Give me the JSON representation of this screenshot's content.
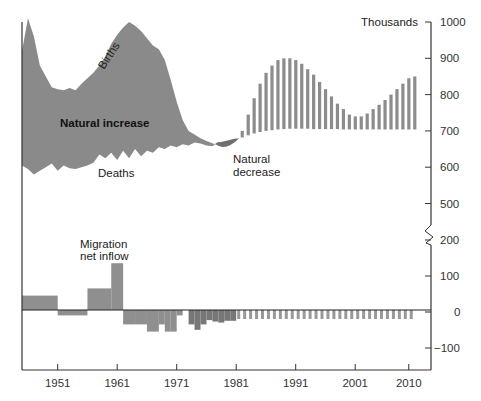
{
  "chart_data": {
    "type": "area",
    "title": "",
    "units_label": "Thousands",
    "xlabel": "",
    "ylabel": "Thousands",
    "x_ticks": [
      "1951",
      "1961",
      "1971",
      "1981",
      "1991",
      "2001",
      "2010"
    ],
    "y_ticks_upper": [
      "1000",
      "900",
      "800",
      "700",
      "600",
      "500"
    ],
    "y_ticks_lower": [
      "200",
      "100",
      "0",
      "−100"
    ],
    "axis_break": "between 500 and 200",
    "ylim_upper": [
      500,
      1000
    ],
    "ylim_lower": [
      -150,
      200
    ],
    "xlim": [
      1945,
      2012
    ],
    "grid": false,
    "annotations": {
      "births": "Births",
      "natural_increase": "Natural increase",
      "deaths": "Deaths",
      "natural_decrease": "Natural decrease",
      "natural_decrease_line1": "Natural",
      "natural_decrease_line2": "decrease",
      "migration_line1": "Migration",
      "migration_line2": "net inflow"
    },
    "series": [
      {
        "name": "Births (historical)",
        "x": [
          1945,
          1946,
          1947,
          1948,
          1949,
          1950,
          1951,
          1952,
          1953,
          1954,
          1955,
          1956,
          1957,
          1958,
          1959,
          1960,
          1961,
          1962,
          1963,
          1964,
          1965,
          1966,
          1967,
          1968,
          1969,
          1970,
          1971,
          1972,
          1973,
          1974,
          1975,
          1976,
          1977,
          1978,
          1979,
          1980,
          1981
        ],
        "values": [
          920,
          1010,
          960,
          880,
          850,
          820,
          815,
          812,
          818,
          812,
          830,
          845,
          860,
          880,
          905,
          940,
          965,
          985,
          1000,
          990,
          975,
          955,
          935,
          925,
          895,
          840,
          780,
          730,
          700,
          690,
          680,
          672,
          666,
          660,
          665,
          668,
          672
        ]
      },
      {
        "name": "Deaths (historical)",
        "x": [
          1945,
          1946,
          1947,
          1948,
          1949,
          1950,
          1951,
          1952,
          1953,
          1954,
          1955,
          1956,
          1957,
          1958,
          1959,
          1960,
          1961,
          1962,
          1963,
          1964,
          1965,
          1966,
          1967,
          1968,
          1969,
          1970,
          1971,
          1972,
          1973,
          1974,
          1975,
          1976,
          1977,
          1978,
          1979,
          1980,
          1981
        ],
        "values": [
          605,
          595,
          580,
          590,
          600,
          610,
          590,
          605,
          597,
          595,
          600,
          605,
          612,
          635,
          625,
          640,
          620,
          645,
          625,
          650,
          630,
          645,
          640,
          655,
          650,
          660,
          655,
          663,
          660,
          668,
          665,
          660,
          658,
          670,
          665,
          675,
          680
        ]
      },
      {
        "name": "Births (projected)",
        "x": [
          1982,
          1983,
          1984,
          1985,
          1986,
          1987,
          1988,
          1989,
          1990,
          1991,
          1992,
          1993,
          1994,
          1995,
          1996,
          1997,
          1998,
          1999,
          2000,
          2001,
          2002,
          2003,
          2004,
          2005,
          2006,
          2007,
          2008,
          2009,
          2010,
          2011
        ],
        "values": [
          700,
          745,
          790,
          830,
          860,
          880,
          895,
          900,
          900,
          895,
          885,
          870,
          855,
          835,
          815,
          795,
          775,
          760,
          745,
          740,
          740,
          748,
          760,
          772,
          785,
          800,
          815,
          830,
          845,
          850
        ]
      },
      {
        "name": "Deaths (projected)",
        "x": [
          1982,
          1983,
          1984,
          1985,
          1986,
          1987,
          1988,
          1989,
          1990,
          1991,
          1992,
          1993,
          1994,
          1995,
          1996,
          1997,
          1998,
          1999,
          2000,
          2001,
          2002,
          2003,
          2004,
          2005,
          2006,
          2007,
          2008,
          2009,
          2010,
          2011
        ],
        "values": [
          682,
          688,
          693,
          697,
          700,
          702,
          704,
          705,
          706,
          706,
          706,
          706,
          705,
          705,
          705,
          705,
          705,
          704,
          704,
          704,
          704,
          704,
          704,
          704,
          704,
          704,
          704,
          704,
          704,
          704
        ]
      },
      {
        "name": "Migration net inflow",
        "type": "bar",
        "bars": [
          {
            "from": 1945,
            "to": 1951,
            "value": 40
          },
          {
            "from": 1951,
            "to": 1956,
            "value": -15
          },
          {
            "from": 1956,
            "to": 1960,
            "value": 60
          },
          {
            "from": 1960,
            "to": 1962,
            "value": 130
          },
          {
            "from": 1962,
            "to": 1964,
            "value": -40
          },
          {
            "from": 1964,
            "to": 1966,
            "value": -40
          },
          {
            "from": 1966,
            "to": 1968,
            "value": -60
          },
          {
            "from": 1968,
            "to": 1969,
            "value": -40
          },
          {
            "from": 1969,
            "to": 1970,
            "value": -60
          },
          {
            "from": 1970,
            "to": 1971,
            "value": -60
          },
          {
            "from": 1971,
            "to": 1972,
            "value": -15
          },
          {
            "from": 1973,
            "to": 1974,
            "value": -40
          },
          {
            "from": 1974,
            "to": 1975,
            "value": -55
          },
          {
            "from": 1975,
            "to": 1976,
            "value": -40
          },
          {
            "from": 1976,
            "to": 1977,
            "value": -28
          },
          {
            "from": 1977,
            "to": 1978,
            "value": -32
          },
          {
            "from": 1978,
            "to": 1979,
            "value": -35
          },
          {
            "from": 1979,
            "to": 1980,
            "value": -30
          },
          {
            "from": 1980,
            "to": 1981,
            "value": -30
          }
        ],
        "projected_value": -25,
        "projected_from": 1981,
        "projected_to": 2011
      }
    ]
  }
}
